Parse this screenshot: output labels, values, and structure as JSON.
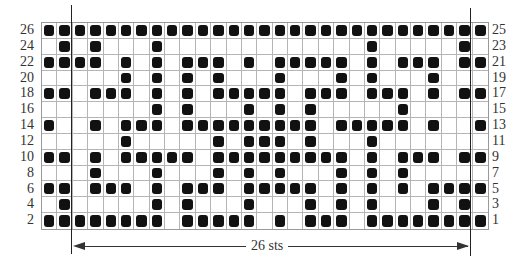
{
  "chart_data": {
    "type": "heatmap",
    "columns": 29,
    "rows": 13,
    "repeat_label": "26 sts",
    "repeat_columns": [
      3,
      28
    ],
    "left_row_labels": [
      "26",
      "24",
      "22",
      "20",
      "18",
      "16",
      "14",
      "12",
      "10",
      "8",
      "6",
      "4",
      "2"
    ],
    "right_row_labels": [
      "25",
      "23",
      "21",
      "19",
      "17",
      "15",
      "13",
      "11",
      "9",
      "7",
      "5",
      "3",
      "1"
    ],
    "filled_color": "#111111",
    "grid_color": "#b5b5b5",
    "filled_cells": {
      "26": [
        1,
        2,
        3,
        4,
        5,
        6,
        7,
        8,
        9,
        10,
        11,
        12,
        13,
        14,
        15,
        16,
        17,
        18,
        19,
        20,
        21,
        22,
        23,
        24,
        25,
        26,
        27,
        28,
        29
      ],
      "24": [
        2,
        4,
        8,
        22,
        28
      ],
      "22": [
        1,
        2,
        3,
        4,
        6,
        8,
        10,
        11,
        12,
        14,
        16,
        17,
        18,
        19,
        20,
        22,
        24,
        25,
        26,
        28,
        29
      ],
      "20": [
        6,
        8,
        10,
        12,
        16,
        20,
        22,
        26
      ],
      "18": [
        1,
        2,
        4,
        5,
        6,
        8,
        10,
        12,
        13,
        14,
        15,
        16,
        18,
        19,
        20,
        22,
        23,
        24,
        26,
        28,
        29
      ],
      "16": [
        8,
        10,
        14,
        16,
        18,
        24
      ],
      "14": [
        1,
        4,
        6,
        7,
        8,
        10,
        11,
        12,
        13,
        14,
        15,
        16,
        17,
        18,
        20,
        21,
        22,
        23,
        24,
        26,
        29
      ],
      "12": [
        6,
        12,
        14,
        15,
        16,
        18,
        22
      ],
      "10": [
        1,
        2,
        4,
        6,
        7,
        8,
        9,
        10,
        12,
        13,
        14,
        15,
        16,
        17,
        18,
        19,
        20,
        22,
        24,
        25,
        26,
        28,
        29
      ],
      "8": [
        4,
        8,
        12,
        14,
        16,
        20,
        22,
        24
      ],
      "6": [
        1,
        2,
        4,
        5,
        6,
        8,
        10,
        11,
        12,
        14,
        15,
        16,
        17,
        18,
        20,
        22,
        24,
        26,
        27,
        28,
        29
      ],
      "4": [
        2,
        8,
        10,
        14,
        18,
        20,
        22,
        26,
        28
      ],
      "2": [
        1,
        2,
        3,
        4,
        5,
        6,
        7,
        8,
        10,
        11,
        12,
        13,
        14,
        16,
        18,
        19,
        20,
        22,
        23,
        24,
        25,
        26,
        27,
        28,
        29
      ]
    }
  }
}
